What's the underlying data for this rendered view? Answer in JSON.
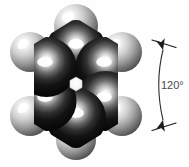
{
  "figure": {
    "kind": "space-filling-molecular-model",
    "molecule_name": "benzene",
    "background_color": "#fefefe",
    "annotation": {
      "angle_label": "120°",
      "label_color": "#4a4a4a",
      "arc_color": "#2b2b2b",
      "arc_width": 1.1,
      "arrow_color": "#1c1c1c",
      "arc": {
        "x1": 163.0,
        "y1": 50.0,
        "cx": 154.5,
        "cy": 84.0,
        "x2": 163.0,
        "y2": 120.0
      },
      "label_pos": {
        "x": 161.0,
        "y": 89.0
      },
      "top_tick": {
        "x1": 152.0,
        "y1": 40.0,
        "x2": 176.0,
        "y2": 47.5
      },
      "bottom_tick": {
        "x1": 152.0,
        "y1": 130.5,
        "x2": 176.0,
        "y2": 123.0
      },
      "top_arrow": {
        "x": 163.0,
        "y": 50.0,
        "angle_deg": -104
      },
      "bottom_arrow": {
        "x": 163.0,
        "y": 120.0,
        "angle_deg": 104
      }
    },
    "ring": {
      "center": {
        "x": 76.0,
        "y": 84.0
      },
      "hole_radius": 7.0,
      "hole_color": "#f4f4f4",
      "hole_edge_color": "#cfcfcf"
    },
    "carbon_atoms": [
      {
        "id": "C1",
        "label": "C",
        "x": 76.0,
        "y": 50.0,
        "r": 30.0,
        "color": "#0d0d0d",
        "highlight": {
          "x": 76.0,
          "y": 44.0
        }
      },
      {
        "id": "C2",
        "label": "C",
        "x": 105.5,
        "y": 67.0,
        "r": 30.0,
        "color": "#0d0d0d",
        "highlight": {
          "x": 104.0,
          "y": 62.0
        }
      },
      {
        "id": "C3",
        "label": "C",
        "x": 105.5,
        "y": 101.0,
        "r": 30.0,
        "color": "#0d0d0d",
        "highlight": {
          "x": 104.0,
          "y": 97.0
        }
      },
      {
        "id": "C4",
        "label": "C",
        "x": 76.0,
        "y": 118.0,
        "r": 30.0,
        "color": "#0d0d0d",
        "highlight": {
          "x": 76.0,
          "y": 113.0
        }
      },
      {
        "id": "C5",
        "label": "C",
        "x": 46.5,
        "y": 101.0,
        "r": 30.0,
        "color": "#0d0d0d",
        "highlight": {
          "x": 45.0,
          "y": 97.0
        }
      },
      {
        "id": "C6",
        "label": "C",
        "x": 46.5,
        "y": 67.0,
        "r": 30.0,
        "color": "#0d0d0d",
        "highlight": {
          "x": 45.0,
          "y": 62.0
        }
      }
    ],
    "hydrogen_atoms": [
      {
        "id": "H1",
        "label": "H",
        "x": 76.0,
        "y": 26.0,
        "r": 22.0,
        "color": "#b9b9b9",
        "highlight": {
          "x": 68.0,
          "y": 17.0
        }
      },
      {
        "id": "H2",
        "label": "H",
        "x": 122.0,
        "y": 52.0,
        "r": 20.0,
        "color": "#b9b9b9",
        "highlight": {
          "x": 115.0,
          "y": 44.0
        }
      },
      {
        "id": "H3",
        "label": "H",
        "x": 122.0,
        "y": 116.0,
        "r": 20.0,
        "color": "#b9b9b9",
        "highlight": {
          "x": 115.0,
          "y": 108.0
        }
      },
      {
        "id": "H4",
        "label": "H",
        "x": 76.0,
        "y": 140.0,
        "r": 20.0,
        "color": "#b9b9b9",
        "highlight": {
          "x": 69.0,
          "y": 132.0
        }
      },
      {
        "id": "H5",
        "label": "H",
        "x": 30.0,
        "y": 116.0,
        "r": 20.0,
        "color": "#b9b9b9",
        "highlight": {
          "x": 23.0,
          "y": 108.0
        }
      },
      {
        "id": "H6",
        "label": "H",
        "x": 30.0,
        "y": 52.0,
        "r": 20.0,
        "color": "#b9b9b9",
        "highlight": {
          "x": 23.0,
          "y": 44.0
        }
      }
    ]
  },
  "chart_data": {
    "type": "diagram",
    "annotations": [
      "120°"
    ],
    "atom_counts": {
      "carbon": 6,
      "hydrogen": 6
    }
  }
}
